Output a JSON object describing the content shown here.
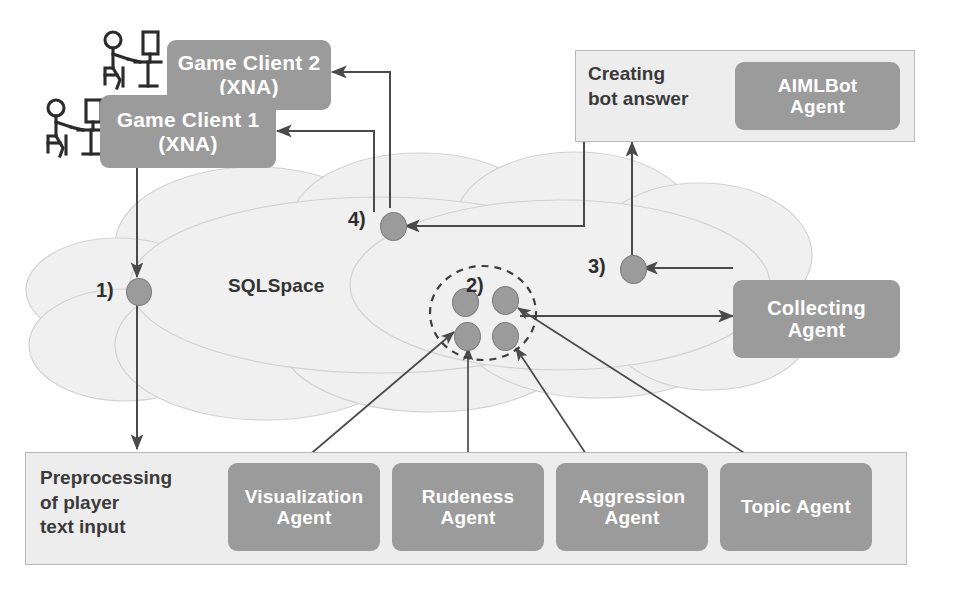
{
  "diagram": {
    "space_label": "SQLSpace",
    "colors": {
      "agent_box": "#9b9b9b",
      "panel": "#ededed",
      "panel_border": "#b9b9b9",
      "cloud_fill": "#f0f0f0",
      "cloud_stroke": "#d2d2d2",
      "tuple_node": "#9b9b9b",
      "edge": "#4a4a4a",
      "box_text": "#ffffff",
      "panel_text": "#3a3a3a"
    },
    "clients": [
      {
        "id": "client2",
        "label": "Game Client 2\n(XNA)",
        "line1": "Game Client 2",
        "line2": "(XNA)"
      },
      {
        "id": "client1",
        "label": "Game Client 1\n(XNA)",
        "line1": "Game Client 1",
        "line2": "(XNA)"
      }
    ],
    "panels": [
      {
        "id": "creating-bot-answer",
        "label": "Creating\nbot answer",
        "line1": "Creating",
        "line2": "bot answer",
        "agents": [
          {
            "id": "aimlbot-agent",
            "line1": "AIMLBot",
            "line2": "Agent",
            "label": "AIMLBot Agent"
          }
        ]
      },
      {
        "id": "preprocessing",
        "label": "Preprocessing\nof player\ntext input",
        "line1": "Preprocessing",
        "line2": "of player",
        "line3": "text input",
        "agents": [
          {
            "id": "visualization-agent",
            "line1": "Visualization",
            "line2": "Agent",
            "label": "Visualization Agent"
          },
          {
            "id": "rudeness-agent",
            "line1": "Rudeness",
            "line2": "Agent",
            "label": "Rudeness Agent"
          },
          {
            "id": "aggression-agent",
            "line1": "Aggression",
            "line2": "Agent",
            "label": "Aggression Agent"
          },
          {
            "id": "topic-agent",
            "line1": "Topic Agent",
            "line2": "",
            "label": "Topic Agent"
          }
        ]
      }
    ],
    "standalone_agents": [
      {
        "id": "collecting-agent",
        "line1": "Collecting",
        "line2": "Agent",
        "label": "Collecting Agent"
      }
    ],
    "steps": [
      {
        "id": "step1",
        "label": "1)",
        "description": "Player text input tuple written to SQLSpace"
      },
      {
        "id": "step2",
        "label": "2)",
        "description": "Analysis agent result tuples grouped in SQLSpace"
      },
      {
        "id": "step3",
        "label": "3)",
        "description": "Collected tuple placed in SQLSpace"
      },
      {
        "id": "step4",
        "label": "4)",
        "description": "Bot answer tuple returned to game clients"
      }
    ],
    "users": [
      {
        "id": "user-client2",
        "label": "player-at-computer"
      },
      {
        "id": "user-client1",
        "label": "player-at-computer"
      }
    ]
  }
}
